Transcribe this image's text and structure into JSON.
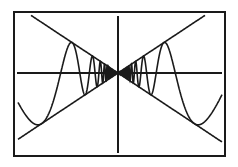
{
  "chart_data": {
    "type": "line",
    "title": "",
    "xlabel": "",
    "ylabel": "",
    "grid": false,
    "legend": null,
    "series": [
      {
        "name": "f(x) = x*sin(a/x)",
        "kind": "function",
        "a": 360,
        "samples": 1600
      },
      {
        "name": "y = x",
        "kind": "line",
        "slope": 1
      },
      {
        "name": "y = -x",
        "kind": "line",
        "slope": -1
      }
    ],
    "xlim": [
      -104,
      104
    ],
    "ylim": [
      -87,
      87
    ]
  },
  "screen": {
    "frame": {
      "left": 14,
      "top": 12,
      "right": 225,
      "bottom": 156
    },
    "origin": {
      "x": 118,
      "y": 73
    },
    "x_axis": {
      "from": 17,
      "to": 222
    },
    "y_axis": {
      "from": 16,
      "to": 153
    },
    "y_scale": 0.663,
    "envelope_left_x": 18,
    "envelope_right_x": 222,
    "color": "#1a1a1a"
  }
}
